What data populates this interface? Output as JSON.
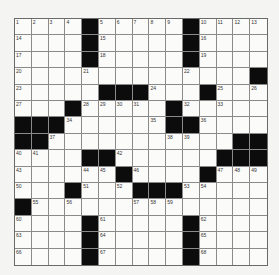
{
  "puzzle": {
    "rows": 15,
    "cols": 15,
    "grid": [
      [
        "1",
        "2",
        "3",
        "4",
        "#",
        "5",
        "6",
        "7",
        "8",
        "9",
        "#",
        "10",
        "11",
        "12",
        "13"
      ],
      [
        "14",
        ".",
        ".",
        ".",
        "#",
        "15",
        ".",
        ".",
        ".",
        ".",
        "#",
        "16",
        ".",
        ".",
        "."
      ],
      [
        "17",
        ".",
        ".",
        ".",
        "#",
        "18",
        ".",
        ".",
        ".",
        ".",
        "#",
        "19",
        ".",
        ".",
        "."
      ],
      [
        "20",
        ".",
        ".",
        ".",
        "21",
        ".",
        ".",
        ".",
        ".",
        ".",
        "22",
        ".",
        ".",
        ".",
        "#"
      ],
      [
        "23",
        ".",
        ".",
        ".",
        ".",
        "#",
        "#",
        "#",
        "24",
        ".",
        ".",
        "#",
        "25",
        ".",
        "26"
      ],
      [
        "27",
        ".",
        ".",
        "#",
        "28",
        "29",
        "30",
        "31",
        ".",
        "#",
        "32",
        ".",
        "33",
        ".",
        "."
      ],
      [
        "#",
        "#",
        "#",
        "34",
        ".",
        ".",
        ".",
        ".",
        "35",
        "#",
        "#",
        "36",
        ".",
        ".",
        "."
      ],
      [
        "#",
        "#",
        "37",
        ".",
        ".",
        ".",
        ".",
        ".",
        ".",
        "38",
        "39",
        ".",
        ".",
        "#",
        "#"
      ],
      [
        "40",
        "41",
        ".",
        ".",
        "#",
        "#",
        "42",
        ".",
        ".",
        ".",
        ".",
        ".",
        "#",
        "#",
        "#"
      ],
      [
        "43",
        ".",
        ".",
        ".",
        "44",
        "45",
        "#",
        "46",
        ".",
        ".",
        ".",
        "#",
        "47",
        "48",
        "49"
      ],
      [
        "50",
        ".",
        ".",
        "#",
        "51",
        ".",
        "52",
        "#",
        "#",
        "#",
        "53",
        "54",
        ".",
        ".",
        "."
      ],
      [
        "#",
        "55",
        ".",
        "56",
        ".",
        ".",
        ".",
        "57",
        "58",
        "59",
        ".",
        ".",
        ".",
        ".",
        "."
      ],
      [
        "60",
        ".",
        ".",
        ".",
        "#",
        "61",
        ".",
        ".",
        ".",
        ".",
        "#",
        "62",
        ".",
        ".",
        "."
      ],
      [
        "63",
        ".",
        ".",
        ".",
        "#",
        "64",
        ".",
        ".",
        ".",
        ".",
        "#",
        "65",
        ".",
        ".",
        "."
      ],
      [
        "66",
        ".",
        ".",
        ".",
        "#",
        "67",
        ".",
        ".",
        ".",
        ".",
        "#",
        "68",
        ".",
        ".",
        "."
      ]
    ],
    "colors": {
      "black_square": "#0c0c0c",
      "white_square": "#fbfbf9",
      "grid_line": "#8a8a8a"
    }
  }
}
